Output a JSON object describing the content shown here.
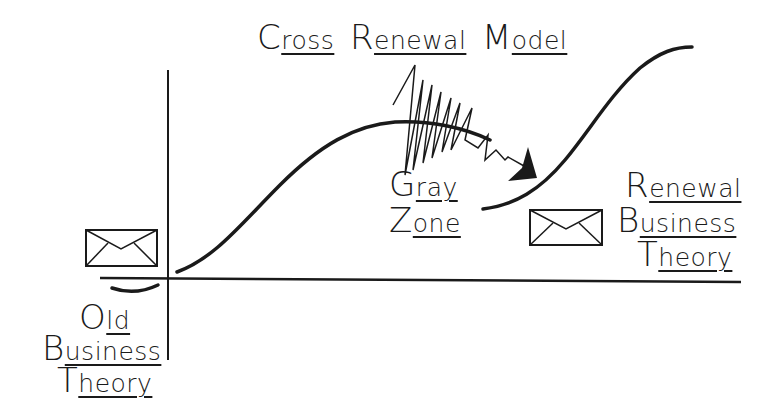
{
  "title": {
    "words": [
      {
        "cap": "C",
        "rest": "ross"
      },
      {
        "cap": "R",
        "rest": "enewal"
      },
      {
        "cap": "M",
        "rest": "odel"
      }
    ],
    "full": "Cross Renewal Model"
  },
  "gray_zone": {
    "line1": {
      "cap": "G",
      "rest": "ray"
    },
    "line2": {
      "cap": "Z",
      "rest": "one"
    },
    "full": "Gray Zone"
  },
  "old_theory": {
    "line1": {
      "cap": "O",
      "rest": "ld"
    },
    "line2": {
      "cap": "B",
      "rest": "usiness"
    },
    "line3": {
      "cap": "T",
      "rest": "heory"
    },
    "full": "Old Business Theory"
  },
  "renewal_theory": {
    "line1": {
      "cap": "R",
      "rest": "enewal"
    },
    "line2": {
      "cap": "B",
      "rest": "usiness"
    },
    "line3": {
      "cap": "T",
      "rest": "heory"
    },
    "full": "Renewal Business Theory"
  },
  "icons": {
    "old_envelope": "envelope-icon",
    "renewal_envelope": "envelope-icon"
  },
  "colors": {
    "ink": "#1a1a1a",
    "background": "#ffffff"
  }
}
